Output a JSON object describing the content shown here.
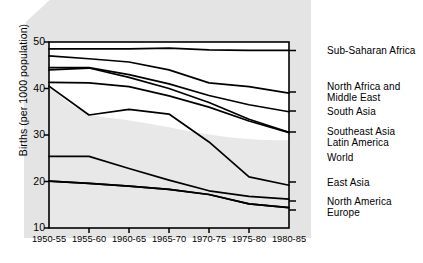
{
  "chart_data": {
    "type": "line",
    "title": "",
    "xlabel": "",
    "ylabel": "Births (per 1000 population)",
    "categories": [
      "1950-55",
      "1955-60",
      "1960-65",
      "1965-70",
      "1970-75",
      "1975-80",
      "1980-85"
    ],
    "ylim": [
      10,
      50
    ],
    "xlim_index": [
      0,
      6
    ],
    "yticks": [
      10,
      20,
      30,
      40,
      50
    ],
    "grid": false,
    "legend_position": "right-inline-end-of-line",
    "background_color": "#e3e3e3",
    "plot_background_color": "#ffffff",
    "line_color": "#000000",
    "series": [
      {
        "name": "Sub-Saharan Africa",
        "values": [
          48.5,
          48.5,
          48.5,
          48.7,
          48.3,
          48.2,
          48.2
        ]
      },
      {
        "name": "North Africa and\nMiddle East",
        "values": [
          47.0,
          46.4,
          45.7,
          44.0,
          41.2,
          40.4,
          39.0
        ]
      },
      {
        "name": "South Asia",
        "values": [
          44.5,
          44.5,
          43.0,
          41.0,
          38.5,
          36.5,
          35.0
        ]
      },
      {
        "name": "Southeast Asia",
        "values": [
          44.0,
          44.4,
          42.4,
          40.0,
          37.0,
          33.4,
          30.6
        ]
      },
      {
        "name": "Latin America",
        "values": [
          41.3,
          41.2,
          40.4,
          38.4,
          36.0,
          33.0,
          30.5
        ]
      },
      {
        "name": "World",
        "values": [
          40.5,
          34.3,
          35.5,
          34.5,
          28.5,
          21.0,
          19.2
        ]
      },
      {
        "name": "East Asia",
        "values": [
          25.4,
          25.4,
          22.8,
          20.3,
          18.0,
          16.8,
          16.2
        ]
      },
      {
        "name": "North America",
        "values": [
          20.1,
          19.6,
          19.0,
          18.3,
          17.2,
          15.2,
          14.4
        ]
      },
      {
        "name": "Europe",
        "values": [
          20.1,
          19.6,
          19.0,
          18.3,
          17.2,
          15.2,
          14.4
        ]
      }
    ],
    "legend_labels": [
      {
        "text": "Sub-Saharan Africa",
        "value": 48.2
      },
      {
        "text": "North Africa and\nMiddle East",
        "value": 39.0
      },
      {
        "text": "South Asia",
        "value": 35.0
      },
      {
        "text": "Southeast Asia\nLatin America",
        "value": 30.6
      },
      {
        "text": "World",
        "value": 27.0
      },
      {
        "text": "East Asia",
        "value": 19.2
      },
      {
        "text": "North America\nEurope",
        "value": 15.0
      }
    ]
  },
  "axis": {
    "y_label": "Births (per 1000 population)",
    "y_ticks": [
      "50",
      "40",
      "30",
      "20",
      "10"
    ],
    "x_ticks": [
      "1950-55",
      "1955-60",
      "1960-65",
      "1965-70",
      "1970-75",
      "1975-80",
      "1980-85"
    ]
  },
  "legend": {
    "items": [
      "Sub-Saharan Africa",
      "North Africa and\nMiddle East",
      "South Asia",
      "Southeast Asia\nLatin America",
      "World",
      "East Asia",
      "North America\nEurope"
    ]
  }
}
